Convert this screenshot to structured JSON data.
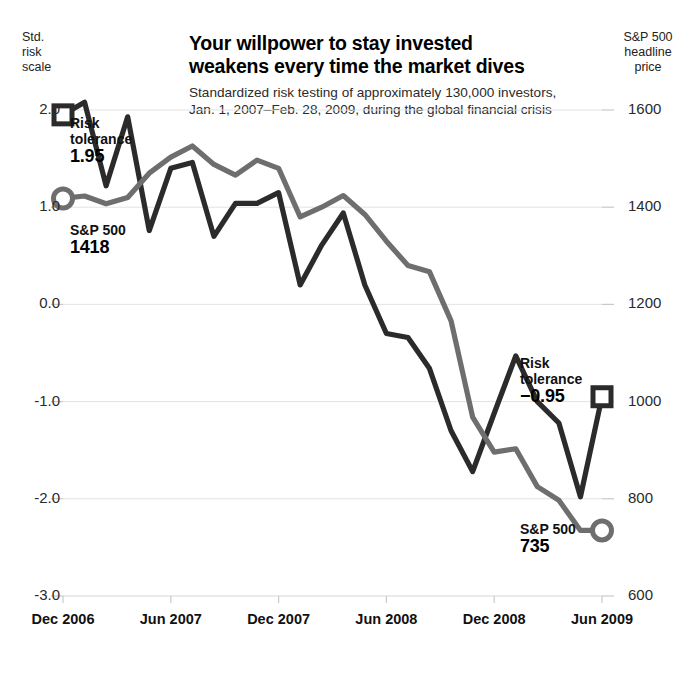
{
  "chart_data": {
    "type": "line",
    "title": "Your willpower to stay invested\nweakens every time the market dives",
    "subtitle": "Standardized risk testing of approximately 130,000 investors,\nJan. 1, 2007–Feb. 28, 2009, during the global financial crisis",
    "xlabel": "",
    "ylabel": "Std.\nrisk\nscale",
    "y2label": "S&P 500\nheadline\nprice",
    "grid": true,
    "legend_position": "annotations",
    "xlim": [
      "Dec 2006",
      "Jun 2009"
    ],
    "ylim": [
      -3.0,
      2.0
    ],
    "y2lim": [
      600,
      1600
    ],
    "xticks": [
      "Dec 2006",
      "Jun 2007",
      "Dec 2007",
      "Jun 2008",
      "Dec 2008",
      "Jun 2009"
    ],
    "yticks": [
      "2.0",
      "1.0",
      "0.0",
      "-1.0",
      "-2.0",
      "-3.0"
    ],
    "y2ticks": [
      "1600",
      "1400",
      "1200",
      "1000",
      "800",
      "600"
    ],
    "series": [
      {
        "name": "Risk tolerance",
        "axis": "left",
        "color": "#2b2b2b",
        "marker": "square",
        "start_value": 1.95,
        "end_value": -0.95,
        "x": [
          0.0,
          0.04,
          0.08,
          0.12,
          0.16,
          0.2,
          0.24,
          0.28,
          0.32,
          0.36,
          0.4,
          0.44,
          0.48,
          0.52,
          0.56,
          0.6,
          0.64,
          0.68,
          0.72,
          0.76,
          0.8,
          0.84,
          0.88,
          0.92,
          0.96,
          1.0
        ],
        "values": [
          1.95,
          2.08,
          1.22,
          1.93,
          0.76,
          1.4,
          1.46,
          0.7,
          1.04,
          1.04,
          1.15,
          0.2,
          0.61,
          0.94,
          0.2,
          -0.3,
          -0.34,
          -0.66,
          -1.3,
          -1.72,
          -1.12,
          -0.53,
          -1.0,
          -1.22,
          -1.98,
          -0.95
        ]
      },
      {
        "name": "S&P 500",
        "axis": "right",
        "color": "#6e6e6e",
        "marker": "circle",
        "start_value": 1418,
        "end_value": 735,
        "x": [
          0.0,
          0.04,
          0.08,
          0.12,
          0.16,
          0.2,
          0.24,
          0.28,
          0.32,
          0.36,
          0.4,
          0.44,
          0.48,
          0.52,
          0.56,
          0.6,
          0.64,
          0.68,
          0.72,
          0.76,
          0.8,
          0.84,
          0.88,
          0.92,
          0.96,
          1.0
        ],
        "values": [
          1418,
          1423,
          1407,
          1420,
          1470,
          1503,
          1526,
          1488,
          1466,
          1497,
          1480,
          1380,
          1400,
          1424,
          1385,
          1330,
          1280,
          1267,
          1166,
          968,
          896,
          903,
          825,
          797,
          735,
          735
        ]
      }
    ],
    "annotations": [
      {
        "id": "risk-left",
        "label": "Risk\ntolerance",
        "value": "1.95",
        "marker": "square"
      },
      {
        "id": "sp-left",
        "label": "S&P 500",
        "value": "1418",
        "marker": "circle"
      },
      {
        "id": "risk-right",
        "label": "Risk\ntolerance",
        "value": "−0.95",
        "marker": "square"
      },
      {
        "id": "sp-right",
        "label": "S&P 500",
        "value": "735",
        "marker": "circle"
      }
    ],
    "colors": {
      "risk_line": "#2b2b2b",
      "sp_line": "#6e6e6e",
      "grid": "#e3e3e3",
      "text": "#111111",
      "background": "#ffffff"
    }
  }
}
